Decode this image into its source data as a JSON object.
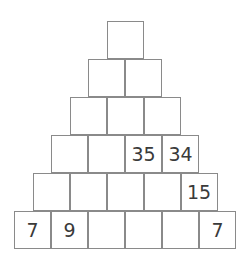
{
  "puzzle": {
    "type": "number-pyramid",
    "rows": [
      [
        "",
        "",
        "",
        "",
        "",
        ""
      ],
      [
        "",
        "",
        "",
        "",
        "",
        ""
      ],
      [
        "",
        "",
        "",
        "",
        "",
        ""
      ],
      [
        "",
        "",
        "",
        "",
        "",
        ""
      ],
      [
        "",
        "",
        "",
        "",
        "",
        ""
      ],
      [
        "",
        "",
        "",
        "",
        "",
        ""
      ]
    ],
    "row_values": [
      [
        ""
      ],
      [
        "",
        ""
      ],
      [
        "",
        "",
        ""
      ],
      [
        "",
        "",
        "35",
        "34"
      ],
      [
        "",
        "",
        "",
        "",
        "15"
      ],
      [
        "7",
        "9",
        "",
        "",
        "",
        "7"
      ]
    ]
  }
}
